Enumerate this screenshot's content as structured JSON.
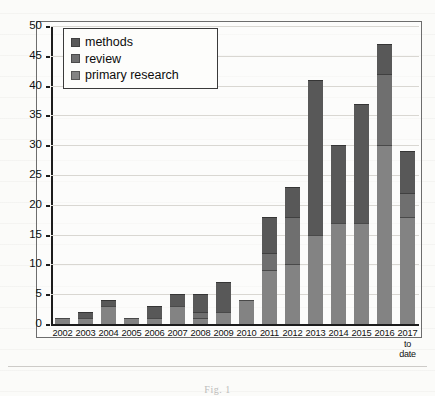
{
  "chart_data": {
    "type": "bar",
    "subtype": "stacked-bar",
    "title": "",
    "xlabel": "",
    "ylabel": "",
    "ylim": [
      0,
      50
    ],
    "ytick_step": 5,
    "yticks": [
      0,
      5,
      10,
      15,
      20,
      25,
      30,
      35,
      40,
      45,
      50
    ],
    "grid": true,
    "legend_position": "top-left",
    "categories": [
      "2002",
      "2003",
      "2004",
      "2005",
      "2006",
      "2007",
      "2008",
      "2009",
      "2010",
      "2011",
      "2012",
      "2013",
      "2014",
      "2015",
      "2016",
      "2017 to date"
    ],
    "category_sublabels": [
      "",
      "",
      "",
      "",
      "",
      "",
      "",
      "",
      "",
      "",
      "",
      "",
      "",
      "",
      "",
      "to date"
    ],
    "series": [
      {
        "name": "primary research",
        "color": "#838383",
        "values": [
          1,
          1,
          3,
          1,
          1,
          3,
          1,
          2,
          4,
          9,
          10,
          15,
          17,
          17,
          30,
          18
        ]
      },
      {
        "name": "review",
        "color": "#6f6f6f",
        "values": [
          0,
          0,
          0,
          0,
          0,
          0,
          1,
          0,
          0,
          3,
          8,
          0,
          0,
          0,
          12,
          4
        ]
      },
      {
        "name": "methods",
        "color": "#585858",
        "values": [
          0,
          1,
          1,
          0,
          2,
          2,
          3,
          5,
          0,
          6,
          5,
          26,
          13,
          20,
          5,
          7
        ]
      }
    ],
    "totals": [
      1,
      2,
      4,
      1,
      3,
      5,
      5,
      7,
      4,
      18,
      23,
      41,
      30,
      37,
      47,
      29
    ]
  },
  "legend": {
    "items": [
      {
        "label": "methods",
        "swatch": "#585858"
      },
      {
        "label": "review",
        "swatch": "#6f6f6f"
      },
      {
        "label": "primary research",
        "swatch": "#838383"
      }
    ]
  },
  "axis": {
    "y_labels": [
      "50",
      "45",
      "40",
      "35",
      "30",
      "25",
      "20",
      "15",
      "10",
      "5",
      "0"
    ],
    "x_labels": [
      {
        "main": "2002",
        "sub": ""
      },
      {
        "main": "2003",
        "sub": ""
      },
      {
        "main": "2004",
        "sub": ""
      },
      {
        "main": "2005",
        "sub": ""
      },
      {
        "main": "2006",
        "sub": ""
      },
      {
        "main": "2007",
        "sub": ""
      },
      {
        "main": "2008",
        "sub": ""
      },
      {
        "main": "2009",
        "sub": ""
      },
      {
        "main": "2010",
        "sub": ""
      },
      {
        "main": "2011",
        "sub": ""
      },
      {
        "main": "2012",
        "sub": ""
      },
      {
        "main": "2013",
        "sub": ""
      },
      {
        "main": "2014",
        "sub": ""
      },
      {
        "main": "2015",
        "sub": ""
      },
      {
        "main": "2016",
        "sub": ""
      },
      {
        "main": "2017",
        "sub": "to date"
      }
    ]
  },
  "caption": {
    "text": "Fig. 1"
  }
}
